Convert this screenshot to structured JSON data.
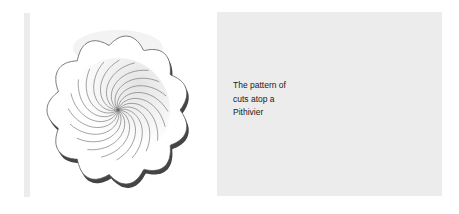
{
  "figure": {
    "illustration": "pithivier-cut-pattern-drawing",
    "caption": "The pattern of cuts atop a Pithivier",
    "caption_lines": [
      "The pattern of",
      "cuts atop a",
      "Pithivier"
    ]
  }
}
